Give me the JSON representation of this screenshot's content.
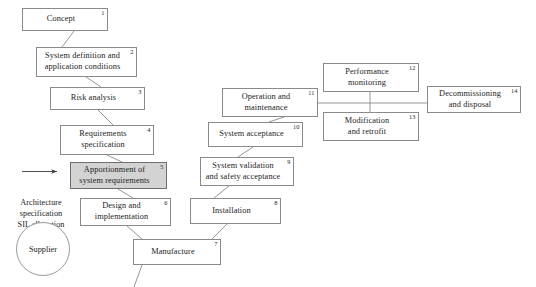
{
  "diagram": {
    "type": "flowchart",
    "background_color": "#ffffff",
    "line_color": "#8a8a8a",
    "text_color": "#1c1c1c",
    "shaded_fill": "#d3d3d3",
    "nodes": [
      {
        "id": "n1",
        "number": "1",
        "label": "Concept",
        "x": 22,
        "y": 8,
        "w": 86,
        "h": 23,
        "shaded": false
      },
      {
        "id": "n2",
        "number": "2",
        "label": "System definition and\napplication conditions",
        "x": 36,
        "y": 47,
        "w": 101,
        "h": 30,
        "shaded": false
      },
      {
        "id": "n3",
        "number": "3",
        "label": "Risk analysis",
        "x": 50,
        "y": 87,
        "w": 95,
        "h": 23,
        "shaded": false
      },
      {
        "id": "n4",
        "number": "4",
        "label": "Requirements\nspecification",
        "x": 60,
        "y": 125,
        "w": 94,
        "h": 30,
        "shaded": false
      },
      {
        "id": "n5",
        "number": "5",
        "label": "Apportionment of\nsystem requirements",
        "x": 70,
        "y": 162,
        "w": 97,
        "h": 27,
        "shaded": true
      },
      {
        "id": "n6",
        "number": "6",
        "label": "Design and\nimplementation",
        "x": 80,
        "y": 198,
        "w": 91,
        "h": 28,
        "shaded": false
      },
      {
        "id": "n7",
        "number": "7",
        "label": "Manufacture",
        "x": 133,
        "y": 239,
        "w": 88,
        "h": 26,
        "shaded": false
      },
      {
        "id": "n8",
        "number": "8",
        "label": "Installation",
        "x": 190,
        "y": 198,
        "w": 91,
        "h": 26,
        "shaded": false
      },
      {
        "id": "n9",
        "number": "9",
        "label": "System validation\nand safety acceptance",
        "x": 200,
        "y": 157,
        "w": 94,
        "h": 29,
        "shaded": false
      },
      {
        "id": "n10",
        "number": "10",
        "label": "System acceptance",
        "x": 208,
        "y": 122,
        "w": 95,
        "h": 25,
        "shaded": false
      },
      {
        "id": "n11",
        "number": "11",
        "label": "Operation and\nmaintenance",
        "x": 222,
        "y": 88,
        "w": 96,
        "h": 29,
        "shaded": false
      },
      {
        "id": "n12",
        "number": "12",
        "label": "Performance\nmonitoring",
        "x": 323,
        "y": 63,
        "w": 96,
        "h": 29,
        "shaded": false
      },
      {
        "id": "n13",
        "number": "13",
        "label": "Modification\nand retrofit",
        "x": 323,
        "y": 112,
        "w": 96,
        "h": 29,
        "shaded": false
      },
      {
        "id": "n14",
        "number": "14",
        "label": "Decommissioning\nand disposal",
        "x": 427,
        "y": 86,
        "w": 94,
        "h": 27,
        "shaded": false
      }
    ],
    "circle": {
      "id": "supplier",
      "label": "Supplier",
      "cx": 43,
      "cy": 249,
      "r": 27
    },
    "side_note": {
      "id": "architecture-note",
      "label": "Architecture\nspecification\nSIL allocation",
      "x": 2,
      "y": 186,
      "w": 78
    },
    "arrow": {
      "id": "architecture-arrow",
      "x1": 22,
      "y1": 172,
      "x2": 58,
      "y2": 172
    },
    "connectors": [
      {
        "from": "n1",
        "to": "n2",
        "path": "M 74,31 L 62,47"
      },
      {
        "from": "n2",
        "to": "n3",
        "path": "M 86,77 L 101,87"
      },
      {
        "from": "n3",
        "to": "n4",
        "path": "M 98,110 L 113,125"
      },
      {
        "from": "n4",
        "to": "n5",
        "path": "M 107,155 L 122,162"
      },
      {
        "from": "n5",
        "to": "n6",
        "path": "M 118,189 L 133,198"
      },
      {
        "from": "n6",
        "to": "n7",
        "path": "M 127,226 L 142,239"
      },
      {
        "from": "n7",
        "to": "n8",
        "path": "M 212,239 L 227,224"
      },
      {
        "from": "n8",
        "to": "n9",
        "path": "M 214,198 L 229,186"
      },
      {
        "from": "n9",
        "to": "n10",
        "path": "M 238,157 L 253,147"
      },
      {
        "from": "n10",
        "to": "n11",
        "path": "M 269,122 L 284,117"
      },
      {
        "from": "n7",
        "to": "offpage",
        "path": "M 142,265 L 135,287"
      },
      {
        "from": "n11",
        "to": "bus",
        "path": "M 318,103 L 427,103"
      },
      {
        "from": "n12",
        "to": "bus",
        "path": "M 370,92 L 370,103"
      },
      {
        "from": "n13",
        "to": "bus",
        "path": "M 370,103 L 370,112"
      }
    ]
  }
}
